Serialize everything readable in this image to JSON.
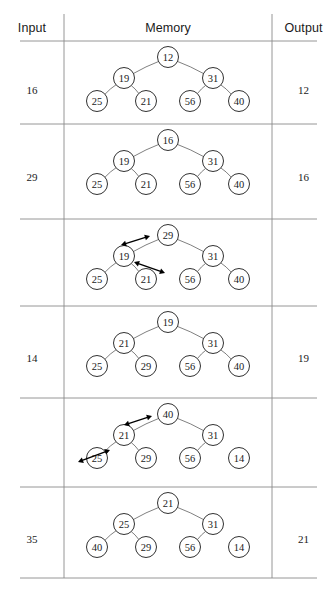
{
  "figure": {
    "headers": {
      "input": "Input",
      "memory": "Memory",
      "output": "Output"
    },
    "geometry": {
      "width": 335,
      "height": 596,
      "col_input_right_x": 64,
      "col_output_left_x": 272,
      "header_rule_y": 41,
      "row_rules_y": [
        41,
        124,
        219,
        306,
        398,
        487,
        578
      ],
      "table_left_x": 20,
      "table_right_x": 317
    },
    "rows": [
      {
        "name": "row-1",
        "input": "16",
        "output": "12",
        "tree": {
          "root": "12",
          "level2": [
            "19",
            "31"
          ],
          "level3": [
            "25",
            "21",
            "56",
            "40"
          ]
        },
        "detached_leaf_index": null,
        "arrows": []
      },
      {
        "name": "row-2",
        "input": "29",
        "output": "16",
        "tree": {
          "root": "16",
          "level2": [
            "19",
            "31"
          ],
          "level3": [
            "25",
            "21",
            "56",
            "40"
          ]
        },
        "detached_leaf_index": null,
        "arrows": []
      },
      {
        "name": "row-3",
        "input": "",
        "output": "",
        "tree": {
          "root": "29",
          "level2": [
            "19",
            "31"
          ],
          "level3": [
            "25",
            "21",
            "56",
            "40"
          ]
        },
        "detached_leaf_index": null,
        "arrows": [
          {
            "name": "swap-arrow-root-left",
            "x1": 121,
            "y1": 245,
            "x2": 150,
            "y2": 236
          },
          {
            "name": "swap-arrow-left-child",
            "x1": 134,
            "y1": 262,
            "x2": 165,
            "y2": 273
          }
        ]
      },
      {
        "name": "row-4",
        "input": "14",
        "output": "19",
        "tree": {
          "root": "19",
          "level2": [
            "21",
            "31"
          ],
          "level3": [
            "25",
            "29",
            "56",
            "40"
          ]
        },
        "detached_leaf_index": null,
        "arrows": []
      },
      {
        "name": "row-5",
        "input": "",
        "output": "",
        "tree": {
          "root": "40",
          "level2": [
            "21",
            "31"
          ],
          "level3": [
            "25",
            "29",
            "56",
            "14"
          ]
        },
        "detached_leaf_index": 3,
        "arrows": [
          {
            "name": "swap-arrow-root-left",
            "x1": 124,
            "y1": 425,
            "x2": 152,
            "y2": 416
          },
          {
            "name": "swap-arrow-left-child",
            "x1": 78,
            "y1": 462,
            "x2": 110,
            "y2": 450
          }
        ]
      },
      {
        "name": "row-6",
        "input": "35",
        "output": "21",
        "tree": {
          "root": "21",
          "level2": [
            "25",
            "31"
          ],
          "level3": [
            "40",
            "29",
            "56",
            "14"
          ]
        },
        "detached_leaf_index": 3,
        "arrows": []
      }
    ],
    "layout": {
      "node_radius": 10.5,
      "root_x": 168,
      "level2_x": [
        124,
        213
      ],
      "level3_x": [
        97,
        146,
        190,
        239
      ],
      "row_offsets": {
        "root_y": 16,
        "level2_y": 37,
        "level3_y": 60
      },
      "row_tops": [
        41,
        124,
        219,
        306,
        398,
        487
      ],
      "value_y_offsets": [
        43,
        47,
        0,
        46,
        0,
        46
      ]
    },
    "colors": {
      "rule": "#8a8a8a",
      "edge": "#555555",
      "node_stroke": "#1a1a1a",
      "node_fill": "#ffffff",
      "text": "#1a1a1a",
      "arrow": "#000000"
    }
  }
}
